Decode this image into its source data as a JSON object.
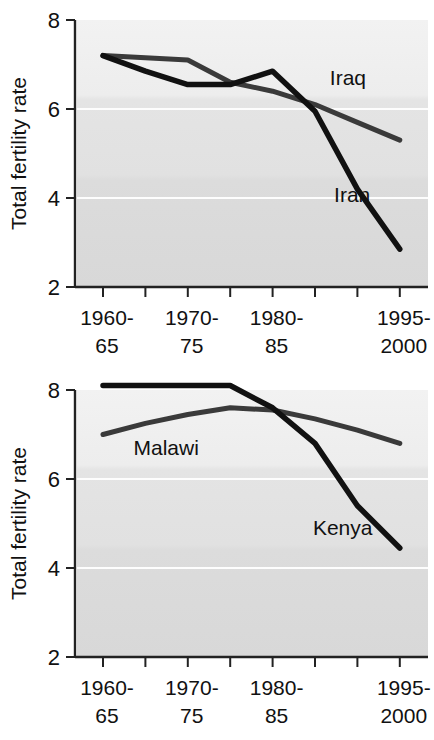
{
  "page": {
    "background_color": "#ffffff"
  },
  "chart_data": [
    {
      "id": "chart-iran-iraq",
      "type": "line",
      "title": "",
      "xlabel": "",
      "ylabel": "Total fertility rate",
      "ylim": [
        2,
        8
      ],
      "yticks": [
        2,
        4,
        6,
        8
      ],
      "ytick_labels": [
        "2",
        "4",
        "6",
        "8"
      ],
      "grid": true,
      "grid_color": "#ffffff",
      "plot_background": "#e6e6e6",
      "legend": "inline-labels",
      "x": [
        "1960-65",
        "1965-70",
        "1970-75",
        "1975-80",
        "1980-85",
        "1985-90",
        "1990-95",
        "1995-2000"
      ],
      "xtick_labels": [
        {
          "line1": "1960-",
          "line2": "65",
          "index": 0
        },
        {
          "line1": "1970-",
          "line2": "75",
          "index": 2
        },
        {
          "line1": "1980-",
          "line2": "85",
          "index": 4
        },
        {
          "line1": "1995-",
          "line2": "2000",
          "index": 7
        }
      ],
      "series": [
        {
          "name": "Iraq",
          "color": "#3a3a3a",
          "stroke_width": 5,
          "label_x_value": 5.35,
          "label_y_value": 6.55,
          "values": [
            7.2,
            7.15,
            7.1,
            6.6,
            6.4,
            6.1,
            5.7,
            5.3
          ]
        },
        {
          "name": "Iran",
          "color": "#111111",
          "stroke_width": 5.5,
          "label_x_value": 5.45,
          "label_y_value": 3.9,
          "values": [
            7.2,
            6.85,
            6.55,
            6.55,
            6.85,
            5.95,
            4.2,
            2.85
          ]
        }
      ]
    },
    {
      "id": "chart-kenya-malawi",
      "type": "line",
      "title": "",
      "xlabel": "",
      "ylabel": "Total fertility rate",
      "ylim": [
        2,
        8
      ],
      "yticks": [
        2,
        4,
        6,
        8
      ],
      "ytick_labels": [
        "2",
        "4",
        "6",
        "8"
      ],
      "grid": true,
      "grid_color": "#ffffff",
      "plot_background": "#e0e0e0",
      "legend": "inline-labels",
      "x": [
        "1960-65",
        "1965-70",
        "1970-75",
        "1975-80",
        "1980-85",
        "1985-90",
        "1990-95",
        "1995-2000"
      ],
      "xtick_labels": [
        {
          "line1": "1960-",
          "line2": "65",
          "index": 0
        },
        {
          "line1": "1970-",
          "line2": "75",
          "index": 2
        },
        {
          "line1": "1980-",
          "line2": "85",
          "index": 4
        },
        {
          "line1": "1995-",
          "line2": "2000",
          "index": 7
        }
      ],
      "series": [
        {
          "name": "Malawi",
          "color": "#3a3a3a",
          "stroke_width": 5,
          "label_x_value": 0.72,
          "label_y_value": 6.55,
          "values": [
            7.0,
            7.25,
            7.45,
            7.6,
            7.55,
            7.35,
            7.1,
            6.8
          ]
        },
        {
          "name": "Kenya",
          "color": "#111111",
          "stroke_width": 5.5,
          "label_x_value": 4.95,
          "label_y_value": 4.75,
          "values": [
            8.1,
            8.1,
            8.1,
            8.1,
            7.6,
            6.8,
            5.4,
            4.45
          ]
        }
      ]
    }
  ]
}
